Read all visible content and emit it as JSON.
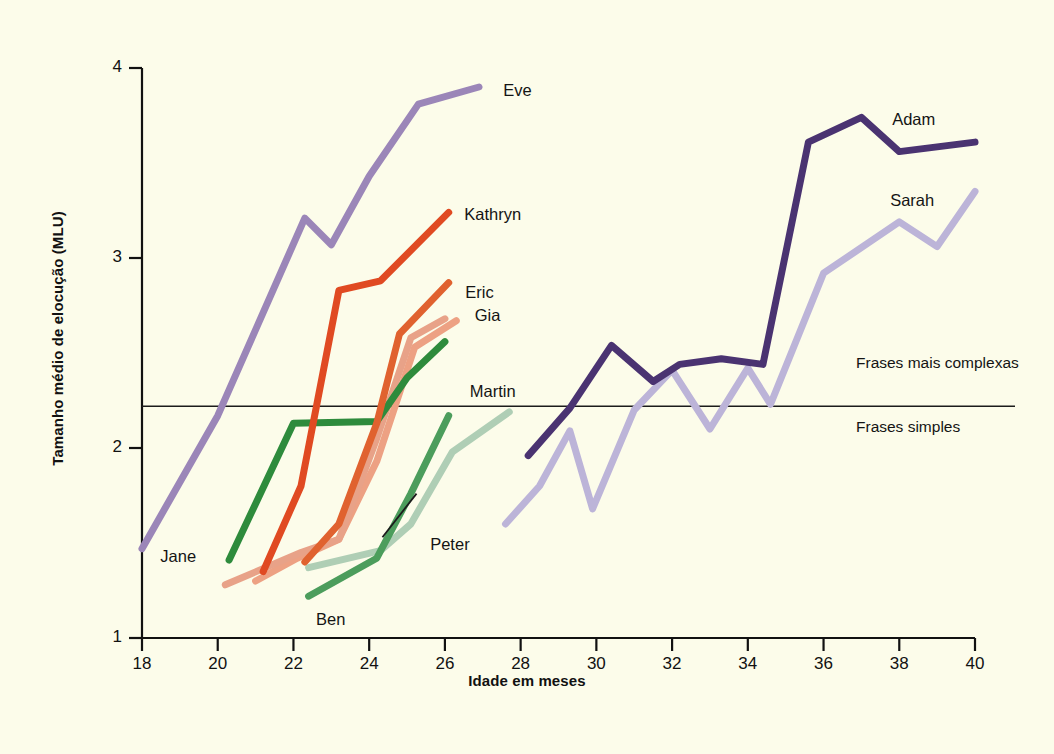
{
  "figure": {
    "background_color": "#fcfcea",
    "axis_color": "#111111",
    "width": 1054,
    "height": 754
  },
  "chart_data": {
    "type": "line",
    "title": "",
    "xlabel": "Idade em meses",
    "ylabel": "Tamanho médio de elocução (MLU)",
    "xlim": [
      18,
      40
    ],
    "ylim": [
      1,
      4
    ],
    "xticks": [
      "18",
      "20",
      "22",
      "24",
      "26",
      "28",
      "30",
      "32",
      "34",
      "36",
      "38",
      "40"
    ],
    "yticks": [
      "1",
      "2",
      "3",
      "4"
    ],
    "grid": false,
    "legend": "inline-labels",
    "annotations": [
      {
        "name": "threshold-line",
        "type": "hline",
        "y": 2.22,
        "label_above": "Frases mais complexas",
        "label_below": "Frases simples"
      },
      {
        "name": "peter-leader-line",
        "type": "leader",
        "from": [
          24.35,
          1.53
        ],
        "to": [
          25.25,
          1.76
        ]
      }
    ],
    "series": [
      {
        "name": "Eve",
        "color": "#9b86b8",
        "width": 7,
        "label_pos": [
          27.3,
          3.88
        ],
        "points": [
          [
            18.0,
            1.47
          ],
          [
            20.0,
            2.17
          ],
          [
            22.3,
            3.21
          ],
          [
            23.0,
            3.07
          ],
          [
            24.0,
            3.43
          ],
          [
            25.3,
            3.81
          ],
          [
            26.9,
            3.9
          ]
        ]
      },
      {
        "name": "Adam",
        "color": "#4a3371",
        "width": 7,
        "label_pos": [
          37.6,
          3.71
        ],
        "points": [
          [
            28.2,
            1.96
          ],
          [
            29.3,
            2.21
          ],
          [
            30.4,
            2.54
          ],
          [
            31.5,
            2.35
          ],
          [
            32.2,
            2.44
          ],
          [
            33.3,
            2.47
          ],
          [
            34.4,
            2.44
          ],
          [
            35.6,
            3.61
          ],
          [
            37.0,
            3.74
          ],
          [
            38.0,
            3.56
          ],
          [
            40.0,
            3.61
          ]
        ]
      },
      {
        "name": "Sarah",
        "color": "#bcb4d8",
        "width": 7,
        "label_pos": [
          37.6,
          3.29
        ],
        "points": [
          [
            27.6,
            1.6
          ],
          [
            28.5,
            1.8
          ],
          [
            29.3,
            2.09
          ],
          [
            29.9,
            1.68
          ],
          [
            31.0,
            2.2
          ],
          [
            32.0,
            2.41
          ],
          [
            33.0,
            2.1
          ],
          [
            34.0,
            2.42
          ],
          [
            34.6,
            2.23
          ],
          [
            36.0,
            2.92
          ],
          [
            38.0,
            3.19
          ],
          [
            39.0,
            3.06
          ],
          [
            40.0,
            3.35
          ]
        ]
      },
      {
        "name": "Kathryn",
        "color": "#e04a22",
        "width": 7,
        "label_pos": [
          26.3,
          3.22
        ],
        "points": [
          [
            21.2,
            1.35
          ],
          [
            22.2,
            1.8
          ],
          [
            23.2,
            2.83
          ],
          [
            24.3,
            2.88
          ],
          [
            26.1,
            3.24
          ]
        ]
      },
      {
        "name": "Eric",
        "color": "#e0622f",
        "width": 7,
        "label_pos": [
          26.3,
          2.81
        ],
        "points": [
          [
            22.3,
            1.4
          ],
          [
            23.2,
            1.6
          ],
          [
            24.2,
            2.13
          ],
          [
            24.8,
            2.6
          ],
          [
            26.1,
            2.87
          ]
        ]
      },
      {
        "name": "Gia",
        "color": "#eda183",
        "width": 7,
        "label_pos": [
          26.6,
          2.69
        ],
        "points": [
          [
            21.0,
            1.3
          ],
          [
            22.1,
            1.42
          ],
          [
            23.2,
            1.52
          ],
          [
            24.2,
            1.93
          ],
          [
            25.2,
            2.53
          ],
          [
            26.3,
            2.67
          ]
        ]
      },
      {
        "name": "Jane",
        "color": "#2e8b3c",
        "width": 7,
        "label_pos": [
          19.7,
          1.47
        ],
        "points": [
          [
            20.3,
            1.41
          ],
          [
            22.0,
            2.13
          ],
          [
            24.2,
            2.14
          ],
          [
            25.0,
            2.37
          ],
          [
            26.0,
            2.56
          ]
        ]
      },
      {
        "name": "Ben",
        "color": "#4c9d5c",
        "width": 7,
        "label_pos": [
          22.7,
          1.18
        ],
        "points": [
          [
            22.4,
            1.22
          ],
          [
            24.2,
            1.42
          ],
          [
            25.1,
            1.76
          ],
          [
            26.1,
            2.17
          ]
        ]
      },
      {
        "name": "Peter",
        "color": "#e8a288",
        "width": 7,
        "label_pos": [
          25.4,
          1.53
        ],
        "points": [
          [
            20.2,
            1.28
          ],
          [
            22.2,
            1.45
          ],
          [
            23.2,
            1.52
          ],
          [
            24.2,
            2.05
          ],
          [
            25.1,
            2.58
          ],
          [
            26.0,
            2.68
          ]
        ]
      },
      {
        "name": "Martin",
        "color": "#afceb5",
        "width": 7,
        "label_pos": [
          26.5,
          2.29
        ],
        "points": [
          [
            22.4,
            1.37
          ],
          [
            24.3,
            1.46
          ],
          [
            25.1,
            1.6
          ],
          [
            26.2,
            1.98
          ],
          [
            27.7,
            2.19
          ]
        ]
      }
    ]
  }
}
